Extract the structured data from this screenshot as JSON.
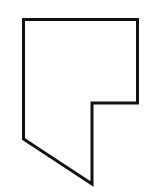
{
  "figure": {
    "type": "polygon-outline",
    "stroke_color": "#111111",
    "fill_color": "#ffffff",
    "background": "#ffffff",
    "stroke_width": 3,
    "vertices": [
      [
        23.5,
        19.5
      ],
      [
        137.5,
        19.5
      ],
      [
        137.5,
        103
      ],
      [
        92,
        103
      ],
      [
        92,
        184
      ],
      [
        23.5,
        139
      ]
    ]
  }
}
